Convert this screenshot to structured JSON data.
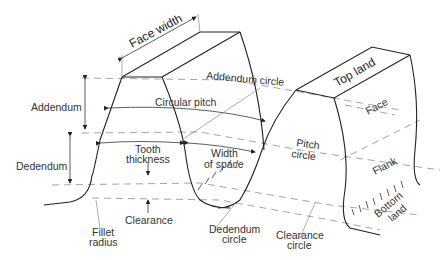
{
  "diagram": {
    "labels": {
      "face_width": "Face width",
      "addendum_circle": "Addendum circle",
      "top_land": "Top land",
      "addendum": "Addendum",
      "circular_pitch": "Circular pitch",
      "face": "Face",
      "pitch_circle_1": "Pitch",
      "pitch_circle_2": "circle",
      "dedendum": "Dedendum",
      "tooth_thickness_1": "Tooth",
      "tooth_thickness_2": "thickness",
      "width_of_space_1": "Width",
      "width_of_space_2": "of space",
      "flank": "Flank",
      "bottom_land_1": "Bottom",
      "bottom_land_2": "land",
      "clearance": "Clearance",
      "fillet_radius_1": "Fillet",
      "fillet_radius_2": "radius",
      "dedendum_circle_1": "Dedendum",
      "dedendum_circle_2": "circle",
      "clearance_circle_1": "Clearance",
      "clearance_circle_2": "circle"
    },
    "colors": {
      "line": "#222222",
      "dashed": "#9a9a9a",
      "text": "#333333",
      "background": "#ffffff"
    }
  }
}
